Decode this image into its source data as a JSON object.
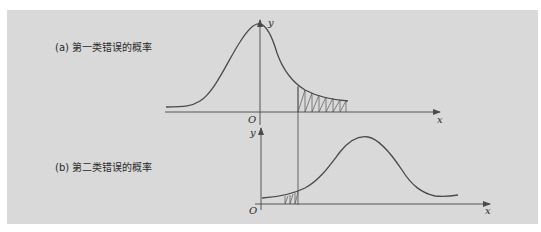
{
  "diagram": {
    "panel_a": {
      "caption": "(a) 第一类错误的概率",
      "origin_label": "O",
      "x_label": "x",
      "y_label": "y",
      "shaded_region": "right tail beyond critical value"
    },
    "panel_b": {
      "caption": "(b) 第二类错误的概率",
      "origin_label": "O",
      "x_label": "x",
      "y_label": "y",
      "shaded_region": "left tail before critical value"
    },
    "colors": {
      "background": "#d9d9d9",
      "line": "#4a4a4a"
    }
  }
}
